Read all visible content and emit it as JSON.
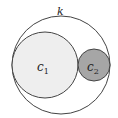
{
  "labels": {
    "outer": "k",
    "c1": "c",
    "c1_sub": "1",
    "c2": "c",
    "c2_sub": "2"
  },
  "colors": {
    "outer_stroke": "#444444",
    "c1_fill": "#eeeeee",
    "c2_fill": "#a6a6a6",
    "stroke": "#444444"
  }
}
